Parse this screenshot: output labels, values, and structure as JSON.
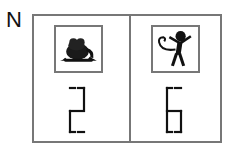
{
  "label": "N",
  "cells": [
    {
      "animal": "frog",
      "number": "2"
    },
    {
      "animal": "monkey",
      "number": "6"
    }
  ],
  "colors": {
    "border": "#777777",
    "ink": "#111111"
  }
}
